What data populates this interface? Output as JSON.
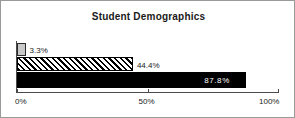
{
  "chart_data": {
    "type": "bar",
    "orientation": "horizontal",
    "title": "Student Demographics",
    "xlabel": "",
    "ylabel": "",
    "xlim": [
      0,
      100
    ],
    "xticks": [
      0,
      50,
      100
    ],
    "xtick_labels": [
      "0%",
      "50%",
      "100%"
    ],
    "grid": false,
    "legend": false,
    "categories": [
      "bar-1",
      "bar-2",
      "bar-3"
    ],
    "values": [
      3.3,
      44.4,
      87.8
    ],
    "data_labels": [
      "3.3%",
      "44.4%",
      "87.8%"
    ],
    "series": [
      {
        "name": "Student Demographics",
        "values": [
          3.3,
          44.4,
          87.8
        ],
        "styles": [
          "gray-fill",
          "diagonal-hatch",
          "solid-black"
        ],
        "label_positions": [
          "outside",
          "outside",
          "inside"
        ]
      }
    ]
  },
  "bars": [
    {
      "value": 3.3,
      "label": "3.3%",
      "style": "gray-fill",
      "label_position": "outside"
    },
    {
      "value": 44.4,
      "label": "44.4%",
      "style": "diagonal-hatch",
      "label_position": "outside"
    },
    {
      "value": 87.8,
      "label": "87.8%",
      "style": "solid-black",
      "label_position": "inside"
    }
  ],
  "axis": {
    "ticks": [
      {
        "value": 0,
        "label": "0%"
      },
      {
        "value": 50,
        "label": "50%"
      },
      {
        "value": 100,
        "label": "100%"
      }
    ]
  },
  "colors": {
    "bar_gray": "#c8c8c8",
    "bar_black": "#000000",
    "axis": "#4a4a4a",
    "text": "#1a1a1a",
    "inside_label": "#ffffff",
    "frame_border": "#9a9a9a",
    "background": "#ffffff"
  }
}
